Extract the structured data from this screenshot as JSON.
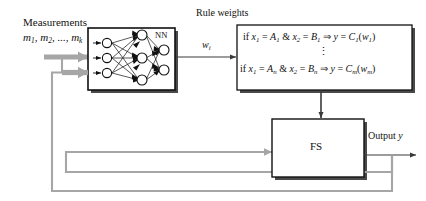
{
  "diagram": {
    "title_labels": {
      "measurements": "Measurements",
      "measurements_vars": "m1, m2, ..., mk",
      "rule_weights": "Rule weights",
      "weight_signal": "wi",
      "output": "Output y"
    },
    "nn_block": {
      "label": "NN",
      "layers": [
        3,
        3,
        2
      ],
      "node_fill": "#ffffff",
      "node_stroke": "#111111",
      "border_color": "#111111"
    },
    "rules_block": {
      "rule_first": {
        "text": "if x1 = A1 & x2 = B1  ⇒  y = C1(w1)",
        "parts": {
          "if": "if",
          "x1": "x",
          "x1_sub": "1",
          "eq": "=",
          "A": "A",
          "A_sub": "1",
          "amp": "&",
          "x2": "x",
          "x2_sub": "2",
          "B": "B",
          "B_sub": "1",
          "implies": "⇒",
          "y": "y",
          "C": "C",
          "C_sub": "1",
          "w": "w",
          "w_sub": "1"
        }
      },
      "ellipsis": "⋮",
      "rule_last": {
        "text": "if x1 = An & x2 = Bn  ⇒  y = Cm(wm)",
        "parts": {
          "if": "if",
          "x1": "x",
          "x1_sub": "1",
          "eq": "=",
          "A": "A",
          "A_sub": "n",
          "amp": "&",
          "x2": "x",
          "x2_sub": "2",
          "B": "B",
          "B_sub": "n",
          "implies": "⇒",
          "y": "y",
          "C": "C",
          "C_sub": "m",
          "w": "w",
          "w_sub": "m"
        }
      }
    },
    "fs_block": {
      "label": "FS"
    },
    "colors": {
      "line_black": "#333333",
      "line_gray": "#a6a6a6",
      "box_border": "#111111",
      "shadow": "#555555",
      "background": "#ffffff"
    },
    "connections": [
      {
        "name": "measurements-to-nn-upper",
        "style": "gray-thick-arrow"
      },
      {
        "name": "measurements-to-nn-lower",
        "style": "gray-thick-arrow"
      },
      {
        "name": "nn-to-rules",
        "style": "black-arrow",
        "label": "wi"
      },
      {
        "name": "rules-to-fs",
        "style": "black-arrow-down"
      },
      {
        "name": "feedback-to-fs",
        "style": "gray-arrow"
      },
      {
        "name": "fs-to-output",
        "style": "black-arrow"
      },
      {
        "name": "output-feedback-upper",
        "style": "gray-loop"
      },
      {
        "name": "output-feedback-lower",
        "style": "gray-loop"
      }
    ]
  }
}
